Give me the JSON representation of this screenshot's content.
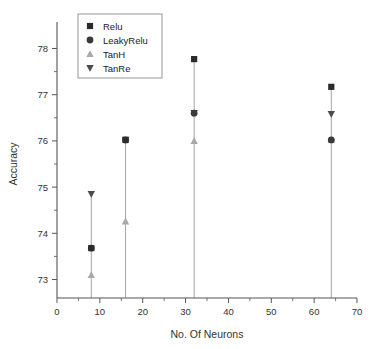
{
  "chart_data": {
    "type": "scatter",
    "title": "",
    "xlabel": "No. Of Neurons",
    "ylabel": "Accuracy",
    "xlim": [
      0,
      70
    ],
    "ylim": [
      72.6,
      78.4
    ],
    "xticks": [
      0,
      10,
      20,
      30,
      40,
      50,
      60,
      70
    ],
    "xtick_labels": [
      "0",
      "10",
      "20",
      "30",
      "40",
      "50",
      "60",
      "70"
    ],
    "yticks": [
      73,
      74,
      75,
      76,
      77,
      78
    ],
    "ytick_labels": [
      "73",
      "74",
      "75",
      "76",
      "77",
      "78"
    ],
    "x_minor_step": 5,
    "y_minor_step": 0.5,
    "grid": false,
    "legend_position": "top-left",
    "categories": [
      8,
      16,
      32,
      64
    ],
    "series": [
      {
        "name": "Relu",
        "marker": "square",
        "color": "#2b2b2b",
        "x": [
          8,
          16,
          32,
          64
        ],
        "values": [
          73.68,
          76.02,
          77.77,
          77.17
        ]
      },
      {
        "name": "LeakyRelu",
        "marker": "circle",
        "color": "#3a3a3a",
        "x": [
          8,
          16,
          32,
          64
        ],
        "values": [
          73.68,
          76.02,
          76.6,
          76.02
        ]
      },
      {
        "name": "TanH",
        "marker": "triangle-up",
        "color": "#a8a8a8",
        "x": [
          8,
          16,
          32,
          64
        ],
        "values": [
          73.1,
          74.26,
          76.0,
          76.02
        ]
      },
      {
        "name": "TanRe",
        "marker": "triangle-down",
        "color": "#4a4a4a",
        "x": [
          8,
          16,
          32,
          64
        ],
        "values": [
          74.85,
          76.02,
          76.6,
          76.58
        ]
      }
    ],
    "stems": [
      {
        "x": 8,
        "y_top": 74.85,
        "y_bottom": 72.6
      },
      {
        "x": 16,
        "y_top": 76.02,
        "y_bottom": 72.6
      },
      {
        "x": 32,
        "y_top": 77.77,
        "y_bottom": 72.6
      },
      {
        "x": 64,
        "y_top": 77.17,
        "y_bottom": 72.6
      }
    ]
  },
  "legend": {
    "items": [
      {
        "label": "Relu"
      },
      {
        "label": "LeakyRelu"
      },
      {
        "label": "TanH"
      },
      {
        "label": "TanRe"
      }
    ]
  },
  "colors": {
    "axis": "#555555",
    "stem": "#9a9a9a",
    "text": "#333333",
    "background": "#ffffff"
  }
}
